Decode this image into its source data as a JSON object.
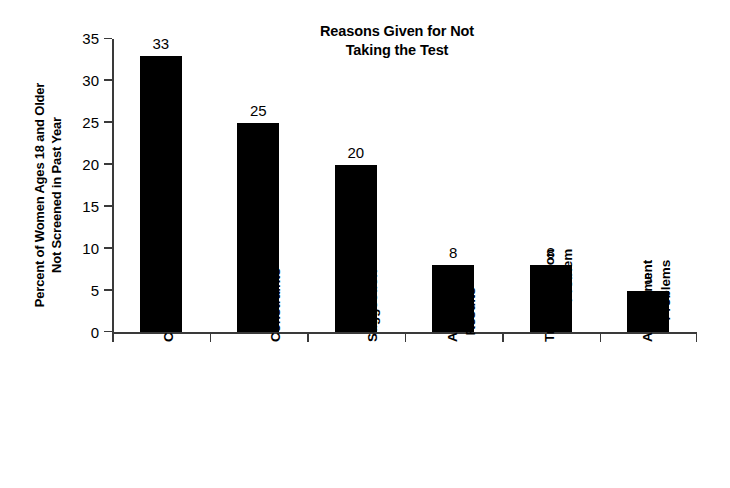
{
  "chart_data": {
    "type": "bar",
    "title": "Reasons Given for Not Taking the Test",
    "title_lines": [
      "Reasons Given for Not",
      "Taking the Test"
    ],
    "xlabel": "",
    "ylabel": "Percent of Women Ages 18 and Older Not Screened in Past Year",
    "ylabel_lines": [
      "Percent of Women Ages 18 and Older",
      "Not Screened in Past Year"
    ],
    "categories": [
      "Cost",
      "Time Constraints",
      "No M.D. Suggestion",
      "Afraid of Results",
      "Transportation Problem",
      "Appointment Problems"
    ],
    "category_lines": [
      [
        "Cost"
      ],
      [
        "Time",
        "Constraints"
      ],
      [
        "No M.D.",
        "Suggestion"
      ],
      [
        "Afraid of",
        "Results"
      ],
      [
        "Transportation",
        "Problem"
      ],
      [
        "Appointment",
        "Problems"
      ]
    ],
    "values": [
      33,
      25,
      20,
      8,
      8,
      5
    ],
    "value_labels": [
      "33",
      "25",
      "20",
      "8",
      "8",
      "5"
    ],
    "ylim": [
      0,
      35
    ],
    "yticks": [
      0,
      5,
      10,
      15,
      20,
      25,
      30,
      35
    ],
    "ytick_labels": [
      "0",
      "5",
      "10",
      "15",
      "20",
      "25",
      "30",
      "35"
    ],
    "grid": false,
    "legend": "none",
    "bar_color": "#000000",
    "axis_color": "#3a3a3a",
    "background_color": "#ffffff"
  }
}
